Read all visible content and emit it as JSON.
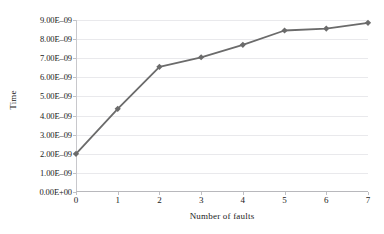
{
  "chart_data": {
    "type": "line",
    "title": "",
    "xlabel": "Number of faults",
    "ylabel": "Time",
    "x": [
      0,
      1,
      2,
      3,
      4,
      5,
      6,
      7
    ],
    "values": [
      2e-09,
      4.35e-09,
      6.55e-09,
      7.05e-09,
      7.7e-09,
      8.45e-09,
      8.55e-09,
      8.85e-09
    ],
    "series": [
      {
        "name": "Time",
        "values": [
          2e-09,
          4.35e-09,
          6.55e-09,
          7.05e-09,
          7.7e-09,
          8.45e-09,
          8.55e-09,
          8.85e-09
        ]
      }
    ],
    "xlim": [
      0,
      7
    ],
    "ylim": [
      0,
      9e-09
    ],
    "ytick_values": [
      0,
      1e-09,
      2e-09,
      3e-09,
      4e-09,
      5e-09,
      6e-09,
      7e-09,
      8e-09,
      9e-09
    ],
    "ytick_labels": [
      "0.00E+00",
      "1.00E–09",
      "2.00E–09",
      "3.00E–09",
      "4.00E–09",
      "5.00E–09",
      "6.00E–09",
      "7.00E–09",
      "8.00E–09",
      "9.00E–09"
    ],
    "xtick_labels": [
      "0",
      "1",
      "2",
      "3",
      "4",
      "5",
      "6",
      "7"
    ],
    "grid": true,
    "legend": false,
    "legend_position": "none",
    "marker": "diamond",
    "colors": {
      "line": "#6b6b6b",
      "marker": "#6b6b6b",
      "gridline": "#e9e9ec",
      "axis": "#c0c0c4",
      "text": "#1a1a1a",
      "background": "#ffffff"
    }
  }
}
